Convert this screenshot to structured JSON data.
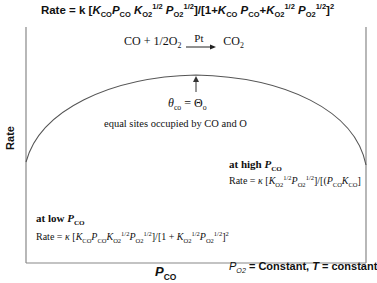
{
  "title": {
    "prefix": "Rate = k [",
    "formula_text": "Rate = k [K_CO P_CO K_O2^1/2 P_O2^1/2]/[1+K_CO P_CO + K_O2^1/2 P_O2^1/2]^2"
  },
  "reaction": {
    "reactants": "CO + 1/2O",
    "reactant_sub": "2",
    "catalyst": "Pt",
    "product": "CO",
    "product_sub": "2"
  },
  "peak_annotation": {
    "condition": "θco = Θo",
    "description": "equal sites occupied by CO and O"
  },
  "high_pco": {
    "heading": "at high P_CO",
    "rate_expression": "Rate = κ [K_O2^1/2 P_O2^1/2]/[(P_CO K_CO]"
  },
  "low_pco": {
    "heading": "at low P_CO",
    "rate_expression": "Rate = κ [K_CO P_CO K_O2^1/2 P_O2^1/2]/[1 + K_O2^1/2 P_O2^1/2]^2"
  },
  "axes": {
    "y_label": "Rate",
    "x_label": "P_CO",
    "conditions": "P_O2 = Constant, T = constant"
  },
  "colors": {
    "line": "#555555",
    "text": "#111111",
    "background": "#ffffff"
  }
}
